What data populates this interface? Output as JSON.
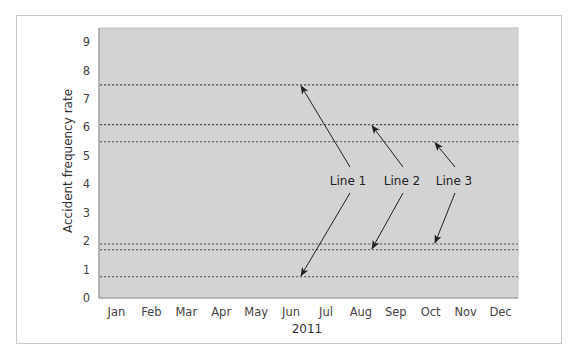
{
  "chart_data": {
    "type": "line",
    "title": "",
    "xlabel": "2011",
    "ylabel": "Accident frequency rate",
    "categories": [
      "Jan",
      "Feb",
      "Mar",
      "Apr",
      "May",
      "Jun",
      "Jul",
      "Aug",
      "Sep",
      "Oct",
      "Nov",
      "Dec"
    ],
    "y_ticks": [
      0,
      1,
      2,
      3,
      4,
      5,
      6,
      7,
      8,
      9
    ],
    "ylim": [
      0,
      9.5
    ],
    "grid": false,
    "legend": null,
    "series": [
      {
        "name": "Line 1 upper",
        "style": "dotted",
        "values": [
          7.5,
          7.5,
          7.5,
          7.5,
          7.5,
          7.5,
          7.5,
          7.5,
          7.5,
          7.5,
          7.5,
          7.5
        ]
      },
      {
        "name": "Line 2 upper",
        "style": "dotted",
        "values": [
          6.1,
          6.1,
          6.1,
          6.1,
          6.1,
          6.1,
          6.1,
          6.1,
          6.1,
          6.1,
          6.1,
          6.1
        ]
      },
      {
        "name": "Line 3 upper",
        "style": "dotted",
        "values": [
          5.5,
          5.5,
          5.5,
          5.5,
          5.5,
          5.5,
          5.5,
          5.5,
          5.5,
          5.5,
          5.5,
          5.5
        ]
      },
      {
        "name": "Line 3 lower",
        "style": "dotted",
        "values": [
          1.9,
          1.9,
          1.9,
          1.9,
          1.9,
          1.9,
          1.9,
          1.9,
          1.9,
          1.9,
          1.9,
          1.9
        ]
      },
      {
        "name": "Line 2 lower",
        "style": "dotted",
        "values": [
          1.7,
          1.7,
          1.7,
          1.7,
          1.7,
          1.7,
          1.7,
          1.7,
          1.7,
          1.7,
          1.7,
          1.7
        ]
      },
      {
        "name": "Line 1 lower",
        "style": "dotted",
        "values": [
          0.75,
          0.75,
          0.75,
          0.75,
          0.75,
          0.75,
          0.75,
          0.75,
          0.75,
          0.75,
          0.75,
          0.75
        ]
      }
    ],
    "annotations": [
      {
        "label": "Line 1",
        "points_to": [
          7.5,
          0.75
        ]
      },
      {
        "label": "Line 2",
        "points_to": [
          6.1,
          1.7
        ]
      },
      {
        "label": "Line 3",
        "points_to": [
          5.5,
          1.9
        ]
      }
    ],
    "colors": {
      "plot_background": "#d3d3d3",
      "plot_border": "#9a9a9a",
      "dotted_line": "#555555",
      "arrow": "#222222",
      "frame_border": "#c9c9c9"
    }
  }
}
